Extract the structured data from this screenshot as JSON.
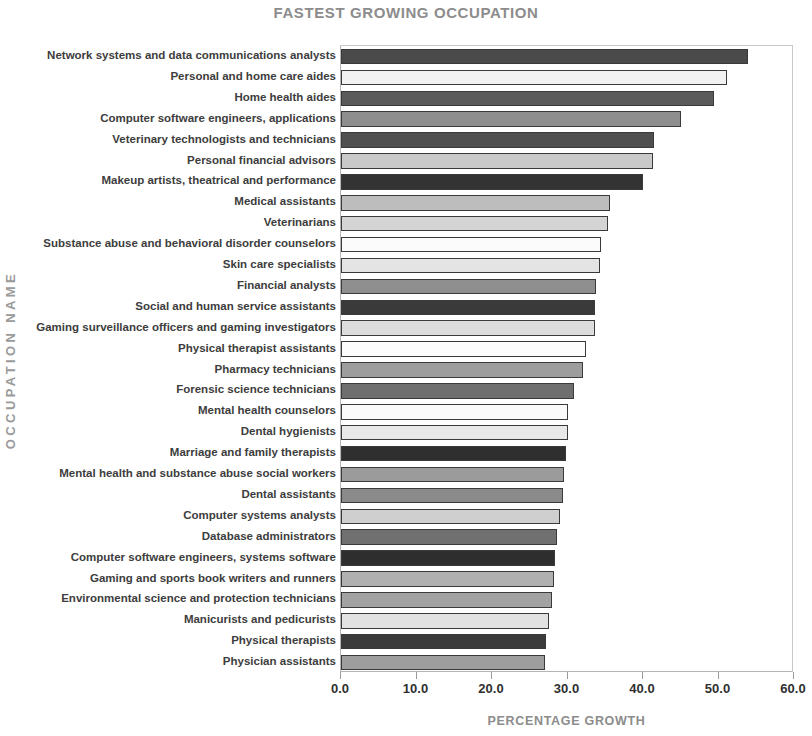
{
  "chart_data": {
    "type": "bar",
    "orientation": "horizontal",
    "title": "FASTEST GROWING OCCUPATION",
    "xlabel": "PERCENTAGE GROWTH",
    "ylabel": "OCCUPATION NAME",
    "xlim": [
      0.0,
      60.0
    ],
    "xticks": [
      "0.0",
      "10.0",
      "20.0",
      "30.0",
      "40.0",
      "50.0",
      "60.0"
    ],
    "xtick_values": [
      0,
      10,
      20,
      30,
      40,
      50,
      60
    ],
    "grid": false,
    "legend": "none",
    "title_color": "#8c8c8c",
    "axis_label_color": "#8c8c8c",
    "bar_border_color": "#3a3a3a",
    "categories": [
      "Network systems and data communications analysts",
      "Personal and home care aides",
      "Home health aides",
      "Computer software engineers, applications",
      "Veterinary technologists and technicians",
      "Personal financial advisors",
      "Makeup artists, theatrical and performance",
      "Medical assistants",
      "Veterinarians",
      "Substance abuse and behavioral disorder counselors",
      "Skin care specialists",
      "Financial analysts",
      "Social and human service assistants",
      "Gaming surveillance officers and gaming investigators",
      "Physical therapist assistants",
      "Pharmacy technicians",
      "Forensic science technicians",
      "Mental health counselors",
      "Dental hygienists",
      "Marriage and family therapists",
      "Mental health and substance abuse social workers",
      "Dental assistants",
      "Computer systems analysts",
      "Database administrators",
      "Computer software engineers, systems software",
      "Gaming and sports book writers and runners",
      "Environmental science and protection technicians",
      "Manicurists and pedicurists",
      "Physical therapists",
      "Physician assistants"
    ],
    "values": [
      53.9,
      51.1,
      49.4,
      45.0,
      41.5,
      41.3,
      40.0,
      35.6,
      35.3,
      34.4,
      34.3,
      33.8,
      33.6,
      33.6,
      32.4,
      32.0,
      30.8,
      30.1,
      30.0,
      29.8,
      29.6,
      29.4,
      29.0,
      28.6,
      28.3,
      28.2,
      28.0,
      27.6,
      27.2,
      27.0
    ],
    "bar_colors": [
      "#4a4a4a",
      "#f2f2f2",
      "#5a5a5a",
      "#8e8e8e",
      "#4f4f4f",
      "#c9c9c9",
      "#333333",
      "#bdbdbd",
      "#d4d4d4",
      "#fbfbfb",
      "#e4e4e4",
      "#8f8f8f",
      "#3a3a3a",
      "#dcdcdc",
      "#fdfdfd",
      "#9d9d9d",
      "#6f6f6f",
      "#fafafa",
      "#e9e9e9",
      "#2f2f2f",
      "#9b9b9b",
      "#8a8a8a",
      "#cfcfcf",
      "#707070",
      "#2e2e2e",
      "#b0b0b0",
      "#a2a2a2",
      "#e2e2e2",
      "#3b3b3b",
      "#9e9e9e"
    ]
  }
}
